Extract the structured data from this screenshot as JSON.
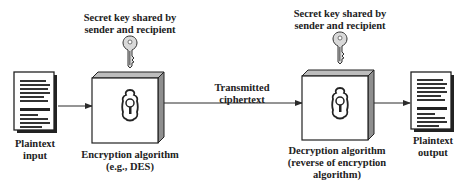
{
  "diagram": {
    "sender_key_label": [
      "Secret key shared by",
      "sender and recipient"
    ],
    "recipient_key_label": [
      "Secret key shared by",
      "sender and recipient"
    ],
    "plaintext_input_label": [
      "Plaintext",
      "input"
    ],
    "encryption_label": [
      "Encryption algorithm",
      "(e.g., DES)"
    ],
    "channel_label": [
      "Transmitted",
      "ciphertext"
    ],
    "decryption_label": [
      "Decryption algorithm",
      "(reverse of encryption",
      "algorithm)"
    ],
    "plaintext_output_label": [
      "Plaintext",
      "output"
    ],
    "colors": {
      "line": "#2b2b2b",
      "box_face": "#ffffff",
      "box_top": "#bdbdbd",
      "box_side": "#8f8f8f",
      "key_fill": "#d9d9d9",
      "text": "#222222"
    },
    "icons": [
      "document-icon",
      "safe-box-icon",
      "key-icon",
      "keyhole-icon",
      "arrow-icon"
    ]
  }
}
